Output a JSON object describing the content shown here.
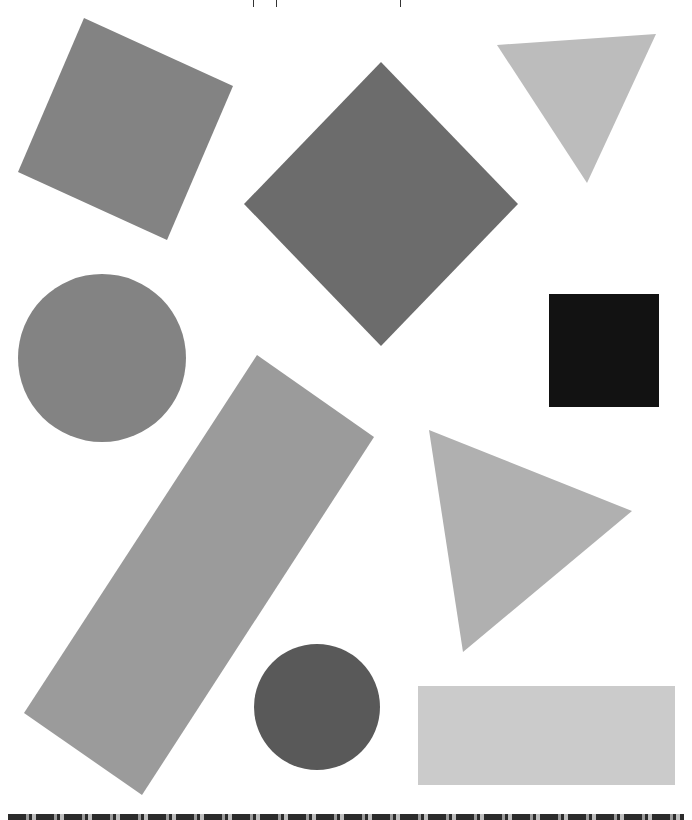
{
  "top_marks": [
    253,
    276,
    400
  ],
  "shapes": [
    {
      "id": "square-tilted",
      "type": "polygon",
      "points": "84,18 233,86 167,240 18,172",
      "fill": "#838383"
    },
    {
      "id": "diamond",
      "type": "polygon",
      "points": "381,62 518,204 381,346 244,204",
      "fill": "#6c6c6c"
    },
    {
      "id": "triangle-down",
      "type": "polygon",
      "points": "497,45 656,34 587,183",
      "fill": "#bcbcbc"
    },
    {
      "id": "circle-large",
      "type": "circle",
      "cx": 102,
      "cy": 358,
      "r": 84,
      "fill": "#838383"
    },
    {
      "id": "black-square",
      "type": "polygon",
      "points": "549,294 659,294 659,407 549,407",
      "fill": "#121212"
    },
    {
      "id": "long-rectangle",
      "type": "polygon",
      "points": "257,355 374,437 142,795 24,713",
      "fill": "#9b9b9b"
    },
    {
      "id": "triangle-right",
      "type": "polygon",
      "points": "429,430 632,511 463,652",
      "fill": "#b0b0b0"
    },
    {
      "id": "circle-dark",
      "type": "circle",
      "cx": 317,
      "cy": 707,
      "r": 63,
      "fill": "#595959"
    },
    {
      "id": "flat-rectangle",
      "type": "polygon",
      "points": "418,686 675,686 675,785 418,785",
      "fill": "#cbcbcb"
    }
  ],
  "colors": {
    "background": "#ffffff",
    "strip": "#2b2b2b"
  }
}
